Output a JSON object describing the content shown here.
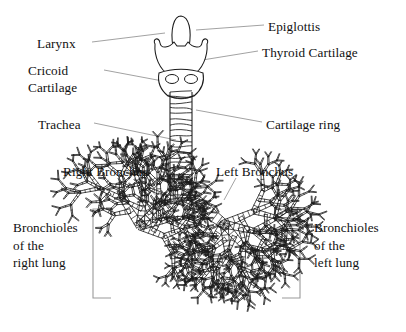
{
  "figure": {
    "kind": "anatomical-line-diagram",
    "background_color": "#ffffff",
    "ink_color": "#1a1a1a",
    "leader_color": "#8a8a8a",
    "bracket_color": "#9a9a9a",
    "width": 406,
    "height": 332
  },
  "labels": {
    "epiglottis": "Epiglottis",
    "thyroid_cartilage": "Thyroid Cartilage",
    "larynx": "Larynx",
    "cricoid_line1": "Cricoid",
    "cricoid_line2": "Cartilage",
    "trachea": "Trachea",
    "cartilage_ring": "Cartilage ring",
    "right_bronchus": "Right Bronchus",
    "left_bronchus": "Left Bronchus",
    "bronchioles_right_line1": "Bronchioles",
    "bronchioles_right_line2": "of the",
    "bronchioles_right_line3": "right lung",
    "bronchioles_left_line1": "Bronchioles",
    "bronchioles_left_line2": "of the",
    "bronchioles_left_line3": "left lung"
  },
  "label_positions": {
    "epiglottis": {
      "x": 268,
      "y": 18,
      "align": "left"
    },
    "thyroid_cartilage": {
      "x": 262,
      "y": 44,
      "align": "left"
    },
    "larynx": {
      "x": 37,
      "y": 35,
      "align": "left"
    },
    "cricoid": {
      "x": 28,
      "y": 62,
      "align": "left"
    },
    "trachea": {
      "x": 38,
      "y": 116,
      "align": "left"
    },
    "cartilage_ring": {
      "x": 266,
      "y": 116,
      "align": "left"
    },
    "right_bronchus": {
      "x": 63,
      "y": 163,
      "align": "left"
    },
    "left_bronchus": {
      "x": 216,
      "y": 163,
      "align": "left"
    },
    "bronchioles_right": {
      "x": 13,
      "y": 219,
      "align": "left"
    },
    "bronchioles_left": {
      "x": 314,
      "y": 219,
      "align": "left"
    }
  },
  "leader_lines": [
    {
      "name": "epiglottis-leader",
      "x1": 264,
      "y1": 25,
      "x2": 196,
      "y2": 30
    },
    {
      "name": "thyroid-cartilage-leader",
      "x1": 258,
      "y1": 51,
      "x2": 190,
      "y2": 62
    },
    {
      "name": "larynx-leader",
      "x1": 92,
      "y1": 42,
      "x2": 165,
      "y2": 33
    },
    {
      "name": "cricoid-leader",
      "x1": 104,
      "y1": 70,
      "x2": 168,
      "y2": 82
    },
    {
      "name": "trachea-leader",
      "x1": 94,
      "y1": 123,
      "x2": 176,
      "y2": 140
    },
    {
      "name": "cartilage-ring-leader",
      "x1": 262,
      "y1": 122,
      "x2": 196,
      "y2": 110
    },
    {
      "name": "right-bronchus-leader",
      "x1": 138,
      "y1": 178,
      "x2": 166,
      "y2": 205
    },
    {
      "name": "left-bronchus-leader",
      "x1": 236,
      "y1": 178,
      "x2": 224,
      "y2": 200
    }
  ],
  "brackets": {
    "right_lung": {
      "name": "bracket-right-lung",
      "x": 93,
      "top": 209,
      "bottom": 298,
      "arm": 18,
      "opens": "right"
    },
    "left_lung": {
      "name": "bracket-left-lung",
      "x": 300,
      "top": 209,
      "bottom": 298,
      "arm": 18,
      "opens": "left"
    }
  },
  "anatomy": {
    "epiglottis": {
      "cx": 181,
      "top": 16,
      "bottom": 47,
      "half_width": 9
    },
    "thyroid_cartilage": {
      "cx": 181,
      "top": 40,
      "bottom": 74,
      "half_width": 26
    },
    "cricoid_cartilage": {
      "cx": 181,
      "top": 70,
      "bottom": 96,
      "half_width": 22,
      "foramina": [
        {
          "cx": 172,
          "cy": 79,
          "rx": 6.5,
          "ry": 4.5
        },
        {
          "cx": 191,
          "cy": 79,
          "rx": 6.5,
          "ry": 4.5
        }
      ]
    },
    "trachea": {
      "cx": 181,
      "top": 92,
      "bottom": 196,
      "half_width": 11,
      "ring_count": 19
    },
    "carina": {
      "x": 181,
      "y": 200
    },
    "right_main_bronchus": {
      "start": [
        175,
        196
      ],
      "end": [
        140,
        226
      ],
      "width": 9
    },
    "left_main_bronchus": {
      "start": [
        187,
        196
      ],
      "end": [
        224,
        224
      ],
      "width": 9
    },
    "right_tree_root": {
      "x": 140,
      "y": 226,
      "angle_deg": 205,
      "length": 34,
      "width": 8,
      "depth": 6
    },
    "left_tree_root": {
      "x": 224,
      "y": 224,
      "angle_deg": -25,
      "length": 34,
      "width": 8,
      "depth": 6
    },
    "ring_spacing_px": 5.5
  }
}
